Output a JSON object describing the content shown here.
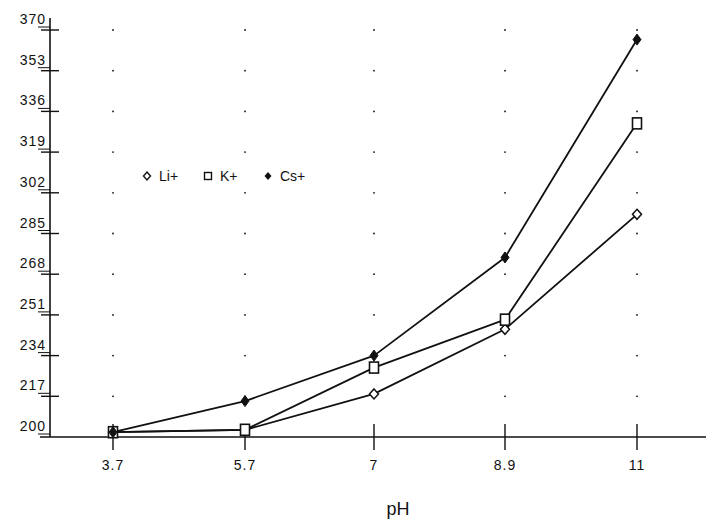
{
  "chart_data": {
    "type": "line",
    "title": "",
    "xlabel": "pH",
    "ylabel": "",
    "x": [
      3.7,
      5.7,
      7,
      8.9,
      11
    ],
    "categories": [
      "3.7",
      "5.7",
      "7",
      "8.9",
      "11"
    ],
    "yticks": [
      200,
      217,
      234,
      251,
      268,
      285,
      302,
      319,
      336,
      353,
      370
    ],
    "ylim": [
      200,
      370
    ],
    "grid": "dotted points at tick intersections",
    "legend_position": "upper-left inside plot",
    "series": [
      {
        "name": "Li+",
        "marker": "open-diamond",
        "values": [
          202,
          203,
          218,
          245,
          293
        ]
      },
      {
        "name": "K+",
        "marker": "open-square",
        "values": [
          202,
          203,
          229,
          249,
          331
        ]
      },
      {
        "name": "Cs+",
        "marker": "filled-diamond",
        "values": [
          202,
          215,
          234,
          275,
          366
        ]
      }
    ]
  },
  "colors": {
    "ink": "#111111",
    "background": "#ffffff"
  }
}
